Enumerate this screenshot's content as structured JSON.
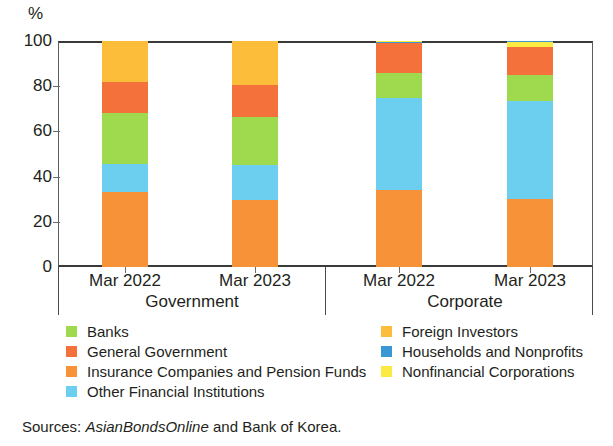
{
  "chart_data": {
    "type": "bar",
    "subtype": "stacked-percentage",
    "title": "",
    "xlabel": "",
    "ylabel": "%",
    "ylim": [
      0,
      100
    ],
    "yticks": [
      0,
      20,
      40,
      60,
      80,
      100
    ],
    "ytick_labels": [
      "0",
      "20",
      "40",
      "60",
      "80",
      "100"
    ],
    "grid": false,
    "legend_position": "below-plot-two-columns",
    "group_labels": [
      "Government",
      "Corporate"
    ],
    "categories": [
      "Mar 2022",
      "Mar 2023",
      "Mar 2022",
      "Mar 2023"
    ],
    "bars": [
      {
        "group": "Government",
        "category": "Mar 2022",
        "segments": [
          {
            "name": "Insurance Companies and Pension Funds",
            "value": 33.0
          },
          {
            "name": "Other Financial Institutions",
            "value": 12.5
          },
          {
            "name": "Banks",
            "value": 22.5
          },
          {
            "name": "General Government",
            "value": 14.0
          },
          {
            "name": "Foreign Investors",
            "value": 18.0
          },
          {
            "name": "Households and Nonprofits",
            "value": 0.0
          },
          {
            "name": "Nonfinancial Corporations",
            "value": 0.0
          }
        ]
      },
      {
        "group": "Government",
        "category": "Mar 2023",
        "segments": [
          {
            "name": "Insurance Companies and Pension Funds",
            "value": 29.5
          },
          {
            "name": "Other Financial Institutions",
            "value": 15.5
          },
          {
            "name": "Banks",
            "value": 21.5
          },
          {
            "name": "General Government",
            "value": 14.0
          },
          {
            "name": "Foreign Investors",
            "value": 19.5
          },
          {
            "name": "Households and Nonprofits",
            "value": 0.0
          },
          {
            "name": "Nonfinancial Corporations",
            "value": 0.0
          }
        ]
      },
      {
        "group": "Corporate",
        "category": "Mar 2022",
        "segments": [
          {
            "name": "Insurance Companies and Pension Funds",
            "value": 34.0
          },
          {
            "name": "Other Financial Institutions",
            "value": 41.0
          },
          {
            "name": "Banks",
            "value": 11.0
          },
          {
            "name": "General Government",
            "value": 13.0
          },
          {
            "name": "Households and Nonprofits",
            "value": 0.5
          },
          {
            "name": "Nonfinancial Corporations",
            "value": 0.5
          }
        ]
      },
      {
        "group": "Corporate",
        "category": "Mar 2023",
        "segments": [
          {
            "name": "Insurance Companies and Pension Funds",
            "value": 30.0
          },
          {
            "name": "Other Financial Institutions",
            "value": 43.5
          },
          {
            "name": "Banks",
            "value": 11.5
          },
          {
            "name": "General Government",
            "value": 12.5
          },
          {
            "name": "Nonfinancial Corporations",
            "value": 2.0
          },
          {
            "name": "Households and Nonprofits",
            "value": 0.5
          }
        ]
      }
    ],
    "series": [
      {
        "name": "Banks",
        "color": "#9ed94e",
        "values": [
          22.5,
          21.5,
          11.0,
          11.5
        ]
      },
      {
        "name": "General Government",
        "color": "#f4713c",
        "values": [
          14.0,
          14.0,
          13.0,
          12.5
        ]
      },
      {
        "name": "Insurance Companies and Pension Funds",
        "color": "#f79239",
        "values": [
          33.0,
          29.5,
          34.0,
          30.0
        ]
      },
      {
        "name": "Other Financial Institutions",
        "color": "#6dcff0",
        "values": [
          12.5,
          15.5,
          41.0,
          43.5
        ]
      },
      {
        "name": "Foreign Investors",
        "color": "#fbbd3a",
        "values": [
          18.0,
          19.5,
          0.0,
          0.0
        ]
      },
      {
        "name": "Households and Nonprofits",
        "color": "#3a97d4",
        "values": [
          0.0,
          0.0,
          0.5,
          0.5
        ]
      },
      {
        "name": "Nonfinancial Corporations",
        "color": "#faea42",
        "values": [
          0.0,
          0.0,
          0.5,
          2.0
        ]
      }
    ]
  },
  "axis": {
    "unit_label": "%",
    "ytick_labels": [
      "100",
      "80",
      "60",
      "40",
      "20",
      "0"
    ]
  },
  "xaxis": {
    "ticklabels": [
      "Mar 2022",
      "Mar 2023",
      "Mar 2022",
      "Mar 2023"
    ],
    "groups": [
      "Government",
      "Corporate"
    ]
  },
  "legend": {
    "left_column": [
      {
        "label": "Banks",
        "color": "#9ed94e"
      },
      {
        "label": "General Government",
        "color": "#f4713c"
      },
      {
        "label": "Insurance Companies and Pension Funds",
        "color": "#f79239"
      },
      {
        "label": "Other Financial Institutions",
        "color": "#6dcff0"
      }
    ],
    "right_column": [
      {
        "label": "Foreign Investors",
        "color": "#fbbd3a"
      },
      {
        "label": "Households and Nonprofits",
        "color": "#3a97d4"
      },
      {
        "label": "Nonfinancial Corporations",
        "color": "#faea42"
      }
    ]
  },
  "source": {
    "prefix": "Sources: ",
    "italic": "AsianBondsOnline",
    "suffix": " and Bank of Korea."
  }
}
